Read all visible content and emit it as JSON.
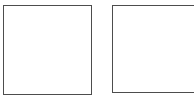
{
  "canvas": {
    "width": 194,
    "height": 112,
    "background_color": "#ffffff",
    "description": "Blank white page containing two empty rectangular outlines side by side"
  },
  "shapes": [
    {
      "name": "left-box",
      "kind": "rectangle-outline",
      "label": "",
      "content": "",
      "x": 3,
      "y": 5,
      "width": 89,
      "height": 90,
      "stroke_color": "#4d4d4d",
      "stroke_width": 1,
      "fill_color": "#ffffff",
      "clipped": "false"
    },
    {
      "name": "right-box",
      "kind": "rectangle-outline",
      "label": "",
      "content": "",
      "x": 112,
      "y": 5,
      "width": 90,
      "height": 88,
      "stroke_color": "#4d4d4d",
      "stroke_width": 1,
      "fill_color": "#ffffff",
      "clipped": "true"
    }
  ]
}
